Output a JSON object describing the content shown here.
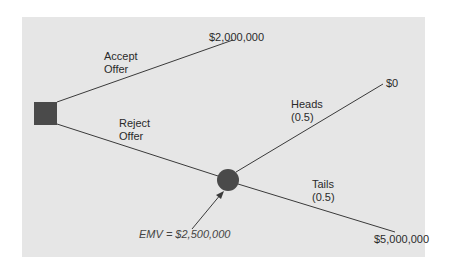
{
  "diagram": {
    "type": "decision-tree",
    "decision_node": {
      "shape": "square",
      "color": "#4a4a4a"
    },
    "chance_node": {
      "shape": "circle",
      "color": "#4a4a4a"
    },
    "branches": {
      "accept": {
        "label_line1": "Accept",
        "label_line2": "Offer",
        "payoff": "$2,000,000"
      },
      "reject": {
        "label_line1": "Reject",
        "label_line2": "Offer"
      },
      "heads": {
        "label_line1": "Heads",
        "label_line2": "(0.5)",
        "payoff": "$0"
      },
      "tails": {
        "label_line1": "Tails",
        "label_line2": "(0.5)",
        "payoff": "$5,000,000"
      }
    },
    "annotation": {
      "text": "EMV = $2,500,000"
    },
    "colors": {
      "panel": "#e6e6e6",
      "line": "#3a3a3a",
      "node": "#4a4a4a"
    }
  }
}
